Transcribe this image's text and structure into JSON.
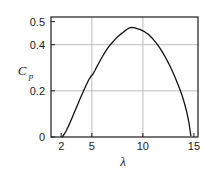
{
  "chart_data": {
    "type": "line",
    "title": "",
    "subtitle": "",
    "xlabel": "λ",
    "ylabel": "C",
    "ylabel_sub": "p",
    "xlim": [
      1.0,
      15.4
    ],
    "ylim": [
      0.0,
      0.52
    ],
    "grid": true,
    "grid_x": [
      5,
      10
    ],
    "grid_y": [
      0.2,
      0.4
    ],
    "legend": null,
    "xticks": [
      2,
      5,
      10,
      15
    ],
    "xtick_labels": [
      "2",
      "5",
      "10",
      "15"
    ],
    "yticks": [
      0,
      0.2,
      0.4,
      0.5
    ],
    "ytick_labels": [
      "0",
      "0.2",
      "0.4",
      "0.5"
    ],
    "line_color": "#111111",
    "grid_color": "#b4b4b4",
    "axis_color": "#1a1a1a",
    "background_color": "#ffffff",
    "series": [
      {
        "name": "Cp",
        "x": [
          2.1,
          2.3,
          2.5,
          2.7,
          2.9,
          3.1,
          3.3,
          3.5,
          3.7,
          3.9,
          4.1,
          4.3,
          4.5,
          4.7,
          4.9,
          5.1,
          5.3,
          5.5,
          5.7,
          5.9,
          6.1,
          6.3,
          6.5,
          6.7,
          6.9,
          7.1,
          7.3,
          7.5,
          7.7,
          7.9,
          8.1,
          8.3,
          8.5,
          8.7,
          8.9,
          9.1,
          9.3,
          9.5,
          9.7,
          9.9,
          10.1,
          10.3,
          10.5,
          10.7,
          10.9,
          11.1,
          11.3,
          11.5,
          11.7,
          11.9,
          12.1,
          12.3,
          12.5,
          12.7,
          12.9,
          13.1,
          13.3,
          13.5,
          13.7,
          13.9,
          14.1,
          14.3,
          14.5,
          14.7
        ],
        "y": [
          0.0,
          0.012,
          0.028,
          0.046,
          0.066,
          0.087,
          0.108,
          0.129,
          0.15,
          0.171,
          0.191,
          0.211,
          0.23,
          0.248,
          0.262,
          0.272,
          0.288,
          0.305,
          0.322,
          0.338,
          0.353,
          0.368,
          0.382,
          0.394,
          0.404,
          0.414,
          0.424,
          0.433,
          0.441,
          0.448,
          0.455,
          0.462,
          0.468,
          0.473,
          0.475,
          0.474,
          0.472,
          0.469,
          0.466,
          0.462,
          0.458,
          0.452,
          0.446,
          0.438,
          0.429,
          0.419,
          0.408,
          0.396,
          0.383,
          0.369,
          0.354,
          0.338,
          0.321,
          0.303,
          0.284,
          0.264,
          0.243,
          0.221,
          0.197,
          0.172,
          0.142,
          0.108,
          0.066,
          0.006
        ]
      }
    ],
    "peak": {
      "x": 8.9,
      "y": 0.475
    }
  },
  "figure": {
    "plot_area": {
      "left": 51,
      "top": 17,
      "right": 198,
      "bottom": 137
    }
  }
}
